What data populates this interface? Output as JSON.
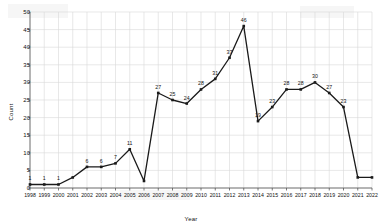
{
  "chart_data": {
    "type": "line",
    "title": "",
    "xlabel": "Year",
    "ylabel": "Count",
    "grid": true,
    "legend": "none",
    "marker": "square",
    "line_color": "#1a1a1a",
    "categories": [
      "1998",
      "1999",
      "2000",
      "2001",
      "2002",
      "2003",
      "2004",
      "2005",
      "2006",
      "2007",
      "2008",
      "2009",
      "2010",
      "2011",
      "2012",
      "2013",
      "2014",
      "2015",
      "2016",
      "2017",
      "2018",
      "2019",
      "2020",
      "2021",
      "2022"
    ],
    "values": [
      1,
      1,
      1,
      3,
      6,
      6,
      7,
      11,
      2,
      27,
      25,
      24,
      28,
      31,
      37,
      46,
      19,
      23,
      28,
      28,
      30,
      27,
      23,
      3,
      3
    ],
    "point_labels": [
      "1",
      "1",
      "1",
      "",
      "6",
      "6",
      "7",
      "11",
      "",
      "27",
      "25",
      "24",
      "28",
      "31",
      "37",
      "46",
      "19",
      "23",
      "28",
      "28",
      "30",
      "27",
      "23",
      "",
      ""
    ],
    "ylim": [
      0,
      50
    ],
    "yticks": [
      0,
      5,
      10,
      15,
      20,
      25,
      30,
      35,
      40,
      45,
      50
    ],
    "xtick_labels": [
      "1998",
      "1999",
      "2000",
      "2001",
      "2002",
      "2003",
      "2004",
      "2005",
      "2006",
      "2007",
      "2008",
      "2009",
      "2010",
      "2011",
      "2012",
      "2013",
      "2014",
      "2015",
      "2016",
      "2017",
      "2018",
      "2019",
      "2020",
      "2021",
      "2022"
    ]
  },
  "colors": {
    "line": "#1a1a1a",
    "grid": "#d8d8d8",
    "axis": "#555555",
    "text": "#111111",
    "background": "#ffffff"
  }
}
